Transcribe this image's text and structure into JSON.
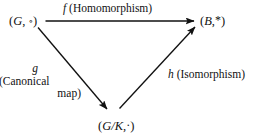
{
  "diagram": {
    "ink_color": "#111111",
    "background_color": "#ffffff",
    "nodes": [
      {
        "id": "domain-group",
        "open_paren": "(",
        "symbol": "G",
        "comma": ", ",
        "operator": "∘",
        "close_paren": ")"
      },
      {
        "id": "codomain-group",
        "open_paren": "(",
        "symbol": "B",
        "comma": ",",
        "operator": "*",
        "close_paren": ")"
      },
      {
        "id": "quotient-group",
        "open_paren": "(",
        "symbol": "G/K",
        "comma": ",",
        "operator": "·",
        "close_paren": ")"
      }
    ],
    "edges": [
      {
        "id": "edge-f",
        "function": "f",
        "description": "(Homomorphism)",
        "from": "domain-group",
        "to": "codomain-group"
      },
      {
        "id": "edge-g",
        "function": "g",
        "description_line_1": "(Canonical",
        "description_line_2": "map)",
        "from": "domain-group",
        "to": "quotient-group"
      },
      {
        "id": "edge-h",
        "function": "h",
        "description": "(Isomorphism)",
        "from": "quotient-group",
        "to": "codomain-group"
      }
    ]
  }
}
